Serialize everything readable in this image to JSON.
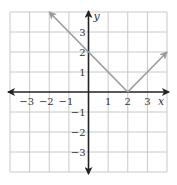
{
  "chart_data": {
    "type": "line",
    "title": "",
    "function": "y = |x - 2|",
    "xlabel": "x",
    "ylabel": "y",
    "xlim": [
      -4,
      4
    ],
    "ylim": [
      -4,
      4
    ],
    "grid": true,
    "x_ticks": [
      -3,
      -2,
      -1,
      1,
      2,
      3
    ],
    "y_ticks": [
      3,
      2,
      1,
      -1,
      -2,
      -3
    ],
    "x_tick_labels": [
      "−3",
      "−2",
      "−1",
      "1",
      "2",
      "3"
    ],
    "y_tick_labels": [
      "3",
      "2",
      "1",
      "−1",
      "−2",
      "−3"
    ],
    "series": [
      {
        "name": "y = |x − 2|",
        "points": [
          [
            -2,
            4
          ],
          [
            2,
            0
          ],
          [
            4,
            2
          ]
        ],
        "arrows": "both-ends"
      }
    ],
    "colors": {
      "grid": "#c8c8c8",
      "axis": "#222222",
      "curve": "#9a9a9a"
    }
  }
}
